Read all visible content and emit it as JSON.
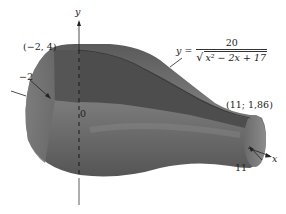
{
  "figure": {
    "axes": {
      "x_label": "x",
      "y_label": "y",
      "origin_label": "0"
    },
    "curve": {
      "lhs": "y =",
      "numerator": "20",
      "denominator": "x² − 2x + 17"
    },
    "points": {
      "left_top": "(−2, 4)",
      "right_top": "(11; 1,86)"
    },
    "bounds": {
      "left": "−2",
      "right": "11"
    },
    "colors": {
      "surface_dark": "#4a4a4a",
      "surface_mid": "#6e6e6e",
      "surface_light": "#9a9a9a",
      "background": "#ffffff"
    }
  }
}
